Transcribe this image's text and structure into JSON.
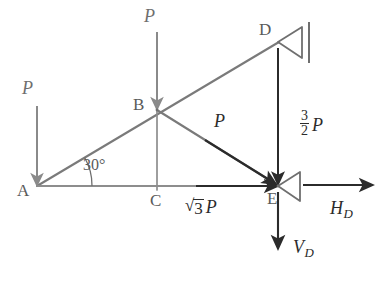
{
  "figure": {
    "type": "engineering-diagram"
  },
  "colors": {
    "member": "#7a7a7a",
    "applied_force": "#8a8a8a",
    "reaction_force": "#2b2b2b",
    "label_gray": "#5a5a5a",
    "label_dark": "#2b2b2b",
    "background": "#ffffff"
  },
  "nodes": [
    {
      "id": "A",
      "label": "A",
      "x": 37,
      "y": 186
    },
    {
      "id": "B",
      "label": "B",
      "x": 157,
      "y": 110
    },
    {
      "id": "C",
      "label": "C",
      "x": 157,
      "y": 186
    },
    {
      "id": "D",
      "label": "D",
      "x": 278,
      "y": 42
    },
    {
      "id": "E",
      "label": "E",
      "x": 278,
      "y": 186
    }
  ],
  "members": [
    {
      "name": "member-A-D",
      "from": "A",
      "to": "D"
    },
    {
      "name": "member-A-E",
      "from": "A",
      "to": "E"
    },
    {
      "name": "member-B-E",
      "from": "B",
      "to": "E"
    },
    {
      "name": "member-B-C",
      "from": "B",
      "to": "C"
    }
  ],
  "angle": {
    "label": "30°",
    "value": 30,
    "at_node": "A",
    "between": [
      "member-A-E",
      "member-A-D"
    ]
  },
  "forces": [
    {
      "name": "force-P-at-A",
      "label": "P",
      "magnitude": "P",
      "direction": "down",
      "style": "applied",
      "at_node": "A"
    },
    {
      "name": "force-P-at-B",
      "label": "P",
      "magnitude": "P",
      "direction": "down",
      "style": "applied",
      "at_node": "B"
    },
    {
      "name": "force-P-diagonal-B-to-E",
      "label": "P",
      "magnitude": "P",
      "direction": "down-right",
      "style": "reaction",
      "at_node": "E"
    },
    {
      "name": "force-sqrt3-P-horizontal",
      "label": "√3 P",
      "radical_radicand": "3",
      "radical_multiplier": "P",
      "direction": "right",
      "style": "reaction",
      "at_node": "E"
    },
    {
      "name": "force-three-halves-P-at-D",
      "label": "3/2 P",
      "fraction_numerator": "3",
      "fraction_denominator": "2",
      "fraction_multiplier": "P",
      "direction": "down",
      "style": "reaction",
      "at_node": "E"
    },
    {
      "name": "reaction-HD",
      "label": "H",
      "subscript": "D",
      "direction": "right",
      "style": "reaction",
      "at_node": "E"
    },
    {
      "name": "reaction-VD",
      "label": "V",
      "subscript": "D",
      "direction": "down",
      "style": "reaction",
      "at_node": "E"
    }
  ],
  "supports": [
    {
      "name": "support-pin-D",
      "at_node": "D",
      "type": "pin-with-wall",
      "orientation": "right"
    },
    {
      "name": "support-pin-E",
      "at_node": "E",
      "type": "pin",
      "orientation": "right"
    }
  ]
}
